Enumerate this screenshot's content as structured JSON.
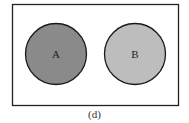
{
  "diagram": {
    "type": "venn-disjoint",
    "sets": [
      {
        "label": "A",
        "fill": "#8a8a8a"
      },
      {
        "label": "B",
        "fill": "#bdbdbd"
      }
    ],
    "frame_stroke": "#222222",
    "caption": "(d)"
  }
}
